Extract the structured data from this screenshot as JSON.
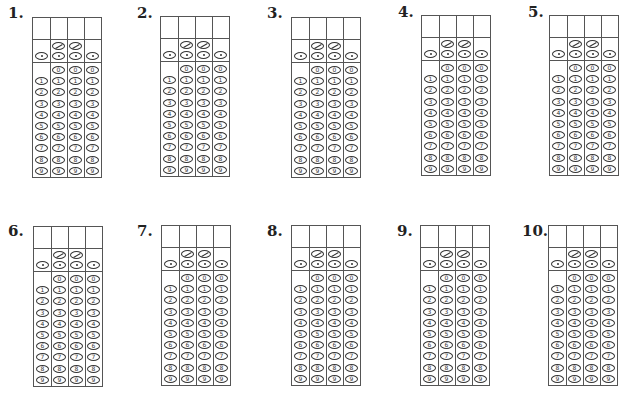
{
  "grid_spec": {
    "columns": 4,
    "slash_columns": [
      1,
      2
    ],
    "dot_columns": [
      0,
      1,
      2,
      3
    ],
    "digit_rows": [
      "0",
      "1",
      "2",
      "3",
      "4",
      "5",
      "6",
      "7",
      "8",
      "9"
    ],
    "zero_columns": [
      1,
      2,
      3
    ],
    "slash_symbol": "/",
    "dot_symbol": "."
  },
  "questions": [
    {
      "label": "1.",
      "label_x": 8,
      "label_y": 4,
      "grid_x": 32,
      "grid_y": 17
    },
    {
      "label": "2.",
      "label_x": 137,
      "label_y": 4,
      "grid_x": 160,
      "grid_y": 16
    },
    {
      "label": "3.",
      "label_x": 267,
      "label_y": 4,
      "grid_x": 291,
      "grid_y": 17
    },
    {
      "label": "4.",
      "label_x": 398,
      "label_y": 3,
      "grid_x": 421,
      "grid_y": 15
    },
    {
      "label": "5.",
      "label_x": 528,
      "label_y": 3,
      "grid_x": 549,
      "grid_y": 15
    },
    {
      "label": "6.",
      "label_x": 8,
      "label_y": 222,
      "grid_x": 33,
      "grid_y": 226
    },
    {
      "label": "7.",
      "label_x": 137,
      "label_y": 222,
      "grid_x": 161,
      "grid_y": 225
    },
    {
      "label": "8.",
      "label_x": 267,
      "label_y": 222,
      "grid_x": 291,
      "grid_y": 225
    },
    {
      "label": "9.",
      "label_x": 397,
      "label_y": 222,
      "grid_x": 420,
      "grid_y": 225
    },
    {
      "label": "10.",
      "label_x": 522,
      "label_y": 222,
      "grid_x": 548,
      "grid_y": 225
    }
  ]
}
